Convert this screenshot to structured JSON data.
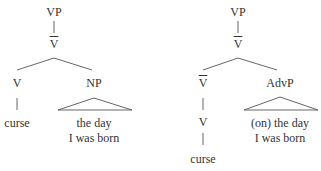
{
  "trees": [
    {
      "root": "VP",
      "vbar": "V",
      "left_child": "V",
      "right_child": "NP",
      "left_terminal": "curse",
      "right_phrase_line1": "the day",
      "right_phrase_line2": "I was born"
    },
    {
      "root": "VP",
      "vbar": "V",
      "left_child": "V",
      "left_subchild": "V",
      "right_child": "AdvP",
      "left_terminal": "curse",
      "right_phrase_line1": "(on) the day",
      "right_phrase_line2": "I was born"
    }
  ]
}
